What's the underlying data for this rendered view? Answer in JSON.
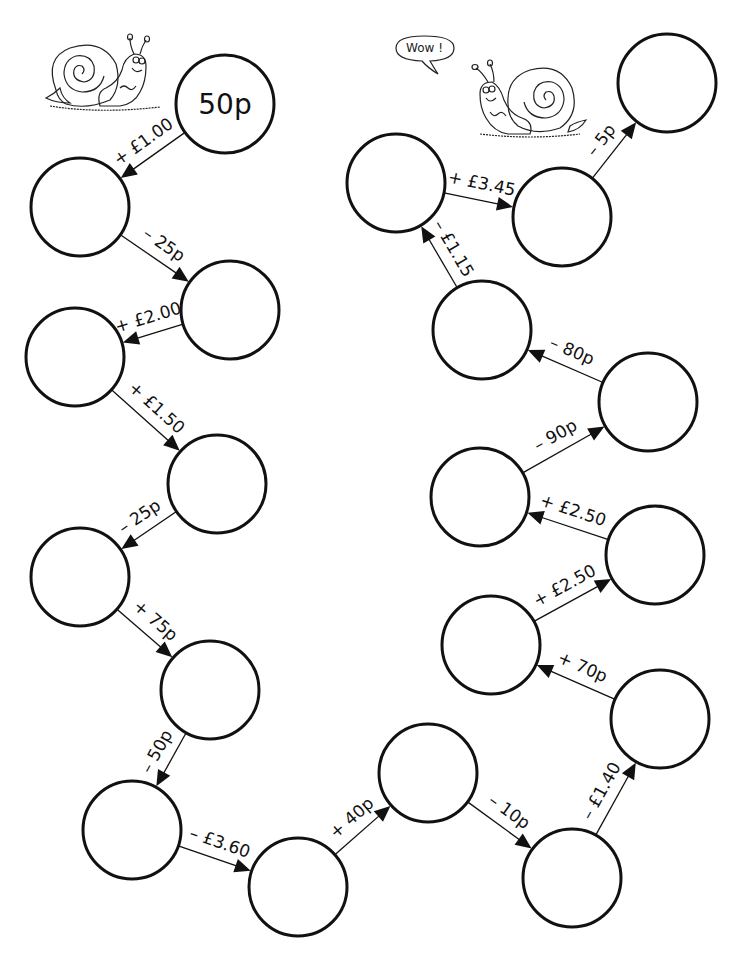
{
  "diagram": {
    "type": "money-chain-worksheet",
    "start_value": "50p",
    "node_radius": 49,
    "nodes": [
      {
        "id": 1,
        "x": 225,
        "y": 104,
        "label": "50p"
      },
      {
        "id": 2,
        "x": 80,
        "y": 207,
        "label": ""
      },
      {
        "id": 3,
        "x": 230,
        "y": 310,
        "label": ""
      },
      {
        "id": 4,
        "x": 75,
        "y": 357,
        "label": ""
      },
      {
        "id": 5,
        "x": 217,
        "y": 484,
        "label": ""
      },
      {
        "id": 6,
        "x": 80,
        "y": 577,
        "label": ""
      },
      {
        "id": 7,
        "x": 210,
        "y": 690,
        "label": ""
      },
      {
        "id": 8,
        "x": 132,
        "y": 830,
        "label": ""
      },
      {
        "id": 9,
        "x": 298,
        "y": 887,
        "label": ""
      },
      {
        "id": 10,
        "x": 428,
        "y": 773,
        "label": ""
      },
      {
        "id": 11,
        "x": 572,
        "y": 878,
        "label": ""
      },
      {
        "id": 12,
        "x": 660,
        "y": 719,
        "label": ""
      },
      {
        "id": 13,
        "x": 491,
        "y": 645,
        "label": ""
      },
      {
        "id": 14,
        "x": 655,
        "y": 555,
        "label": ""
      },
      {
        "id": 15,
        "x": 480,
        "y": 497,
        "label": ""
      },
      {
        "id": 16,
        "x": 648,
        "y": 402,
        "label": ""
      },
      {
        "id": 17,
        "x": 482,
        "y": 330,
        "label": ""
      },
      {
        "id": 18,
        "x": 396,
        "y": 183,
        "label": ""
      },
      {
        "id": 19,
        "x": 562,
        "y": 217,
        "label": ""
      },
      {
        "id": 20,
        "x": 667,
        "y": 83,
        "label": ""
      }
    ],
    "edges": [
      {
        "from": 1,
        "to": 2,
        "label": "+ £1.00"
      },
      {
        "from": 2,
        "to": 3,
        "label": "– 25p"
      },
      {
        "from": 3,
        "to": 4,
        "label": "+ £2.00"
      },
      {
        "from": 4,
        "to": 5,
        "label": "+ £1.50"
      },
      {
        "from": 5,
        "to": 6,
        "label": "– 25p"
      },
      {
        "from": 6,
        "to": 7,
        "label": "+ 75p"
      },
      {
        "from": 7,
        "to": 8,
        "label": "– 50p"
      },
      {
        "from": 8,
        "to": 9,
        "label": "– £3.60"
      },
      {
        "from": 9,
        "to": 10,
        "label": "+ 40p"
      },
      {
        "from": 10,
        "to": 11,
        "label": "– 10p"
      },
      {
        "from": 11,
        "to": 12,
        "label": "– £1.40"
      },
      {
        "from": 12,
        "to": 13,
        "label": "+ 70p"
      },
      {
        "from": 13,
        "to": 14,
        "label": "+ £2.50"
      },
      {
        "from": 14,
        "to": 15,
        "label": "+ £2.50"
      },
      {
        "from": 15,
        "to": 16,
        "label": "– 90p"
      },
      {
        "from": 16,
        "to": 17,
        "label": "– 80p"
      },
      {
        "from": 17,
        "to": 18,
        "label": "– £1.15"
      },
      {
        "from": 18,
        "to": 19,
        "label": "+ £3.45"
      },
      {
        "from": 19,
        "to": 20,
        "label": "– 5p"
      }
    ]
  },
  "illustrations": {
    "snail_left": {
      "label": "snail"
    },
    "snail_right": {
      "label": "snail",
      "speech_bubble": "Wow !"
    }
  },
  "colors": {
    "stroke": "#111111",
    "background": "#ffffff"
  }
}
